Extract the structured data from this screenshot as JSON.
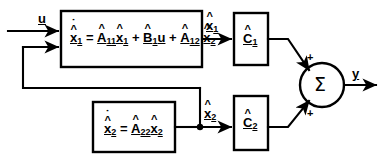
{
  "diagram": {
    "background_color": "#ffffff",
    "line_color": "#000000"
  },
  "signals": {
    "input": {
      "symbol": "u",
      "underlined": true
    },
    "state1": {
      "symbol": "x",
      "subscript": "1",
      "hat": true,
      "underlined": true
    },
    "state2": {
      "symbol": "x",
      "subscript": "2",
      "hat": true,
      "underlined": true
    },
    "output": {
      "symbol": "y",
      "underlined": true
    }
  },
  "blocks": {
    "block1": {
      "name": "state-equation-1",
      "equation_plain": "x1_dot_hat = A11_hat x1_hat + B1_hat u + A12_hat x2_hat",
      "lhs": {
        "symbol": "x",
        "subscript": "1",
        "hat": true,
        "dot": true,
        "underlined": true
      },
      "equals": "=",
      "terms": [
        {
          "matrix": {
            "symbol": "A",
            "subscript": "11",
            "hat": true,
            "underlined": true
          },
          "vector": {
            "symbol": "x",
            "subscript": "1",
            "hat": true,
            "underlined": true
          }
        },
        {
          "operator": "+",
          "matrix": {
            "symbol": "B",
            "subscript": "1",
            "hat": true,
            "underlined": true
          },
          "vector": {
            "symbol": "u",
            "hat": false,
            "underlined": true
          }
        },
        {
          "operator": "+",
          "matrix": {
            "symbol": "A",
            "subscript": "12",
            "hat": true,
            "underlined": true
          },
          "vector": {
            "symbol": "x",
            "subscript": "2",
            "hat": true,
            "underlined": true
          }
        }
      ]
    },
    "block2": {
      "name": "state-equation-2",
      "equation_plain": "x2_dot_hat = A22_hat x2_hat",
      "lhs": {
        "symbol": "x",
        "subscript": "2",
        "hat": true,
        "dot": true,
        "underlined": true
      },
      "equals": "=",
      "terms": [
        {
          "matrix": {
            "symbol": "A",
            "subscript": "22",
            "hat": true,
            "underlined": true
          },
          "vector": {
            "symbol": "x",
            "subscript": "2",
            "hat": true,
            "underlined": true
          }
        }
      ]
    },
    "gain1": {
      "name": "output-matrix-1",
      "symbol": "C",
      "subscript": "1",
      "hat": true,
      "underlined": true
    },
    "gain2": {
      "name": "output-matrix-2",
      "symbol": "C",
      "subscript": "2",
      "hat": true,
      "underlined": true
    }
  },
  "summer": {
    "name": "summing-junction",
    "glyph": "Σ",
    "sign_top": "+",
    "sign_bottom": "+"
  }
}
